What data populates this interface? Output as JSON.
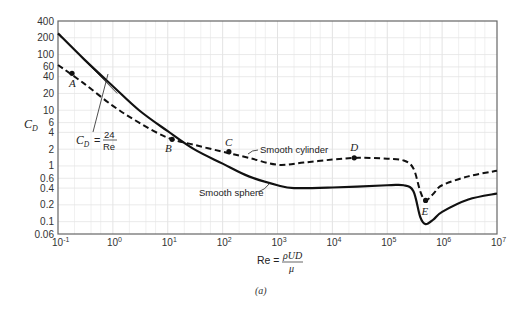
{
  "chart_data": {
    "type": "line",
    "title": "",
    "caption": "(a)",
    "xlabel": "Re = ρUD/μ",
    "xlabel_parts": {
      "prefix": "Re =",
      "numerator": "ρUD",
      "denominator": "μ"
    },
    "ylabel": "C_D",
    "xscale": "log",
    "yscale": "log",
    "xlim": [
      0.1,
      10000000
    ],
    "ylim": [
      0.06,
      400
    ],
    "grid": true,
    "x_ticks": [
      {
        "base": "10",
        "exp": "-1",
        "value": 0.1
      },
      {
        "base": "10",
        "exp": "0",
        "value": 1
      },
      {
        "base": "10",
        "exp": "1",
        "value": 10
      },
      {
        "base": "10",
        "exp": "2",
        "value": 100
      },
      {
        "base": "10",
        "exp": "3",
        "value": 1000
      },
      {
        "base": "10",
        "exp": "4",
        "value": 10000
      },
      {
        "base": "10",
        "exp": "5",
        "value": 100000
      },
      {
        "base": "10",
        "exp": "6",
        "value": 1000000
      },
      {
        "base": "10",
        "exp": "7",
        "value": 10000000
      }
    ],
    "y_ticks": [
      "400",
      "200",
      "100",
      "60",
      "40",
      "20",
      "10",
      "6",
      "4",
      "2",
      "1",
      "0.6",
      "0.4",
      "0.2",
      "0.1",
      "0.06"
    ],
    "y_tick_values": [
      400,
      200,
      100,
      60,
      40,
      20,
      10,
      6,
      4,
      2,
      1,
      0.6,
      0.4,
      0.2,
      0.1,
      0.06
    ],
    "series": [
      {
        "name": "Smooth sphere",
        "style": "solid",
        "x": [
          0.1,
          0.3,
          1,
          3,
          10,
          30,
          100,
          300,
          1000,
          2000,
          10000,
          100000,
          200000,
          300000,
          400000,
          500000,
          700000,
          1000000,
          3000000,
          10000000
        ],
        "y": [
          240,
          82,
          27,
          10,
          4.2,
          2.0,
          1.1,
          0.65,
          0.45,
          0.4,
          0.41,
          0.45,
          0.45,
          0.35,
          0.12,
          0.09,
          0.11,
          0.15,
          0.25,
          0.32
        ]
      },
      {
        "name": "Smooth cylinder",
        "style": "dashed",
        "x": [
          0.1,
          0.3,
          1,
          3,
          10,
          30,
          100,
          300,
          1000,
          3000,
          10000,
          30000,
          100000,
          200000,
          300000,
          400000,
          500000,
          700000,
          1000000,
          3000000,
          10000000
        ],
        "y": [
          65,
          30,
          12,
          6.0,
          3.2,
          2.4,
          1.8,
          1.4,
          1.05,
          1.15,
          1.3,
          1.4,
          1.35,
          1.25,
          0.9,
          0.35,
          0.24,
          0.32,
          0.45,
          0.65,
          0.82
        ]
      },
      {
        "name": "C_D = 24/Re",
        "style": "thin",
        "x": [
          0.3,
          1.2
        ],
        "y": [
          80,
          20
        ]
      }
    ],
    "points": [
      {
        "label": "A",
        "x": 0.18,
        "y": 46,
        "series": "Smooth cylinder"
      },
      {
        "label": "B",
        "x": 12,
        "y": 3.0,
        "series": "Smooth cylinder"
      },
      {
        "label": "C",
        "x": 130,
        "y": 1.8,
        "series": "Smooth cylinder"
      },
      {
        "label": "D",
        "x": 25000,
        "y": 1.4,
        "series": "Smooth cylinder"
      },
      {
        "label": "E",
        "x": 500000,
        "y": 0.24,
        "series": "Smooth cylinder"
      }
    ],
    "annotations": [
      {
        "text": "Smooth cylinder",
        "target": "Smooth cylinder"
      },
      {
        "text": "Smooth sphere",
        "target": "Smooth sphere"
      },
      {
        "text": "C_D = 24/Re",
        "target": "Stokes law line"
      }
    ]
  },
  "labels": {
    "ylabel_main": "C",
    "ylabel_sub": "D",
    "stokes_lhs_main": "C",
    "stokes_lhs_sub": "D",
    "stokes_eq": "=",
    "stokes_num": "24",
    "stokes_den": "Re",
    "cylinder": "Smooth cylinder",
    "sphere": "Smooth sphere",
    "xlabel_prefix": "Re =",
    "xlabel_num": "ρUD",
    "xlabel_den": "μ",
    "caption": "(a)",
    "point_A": "A",
    "point_B": "B",
    "point_C": "C",
    "point_D": "D",
    "point_E": "E"
  }
}
